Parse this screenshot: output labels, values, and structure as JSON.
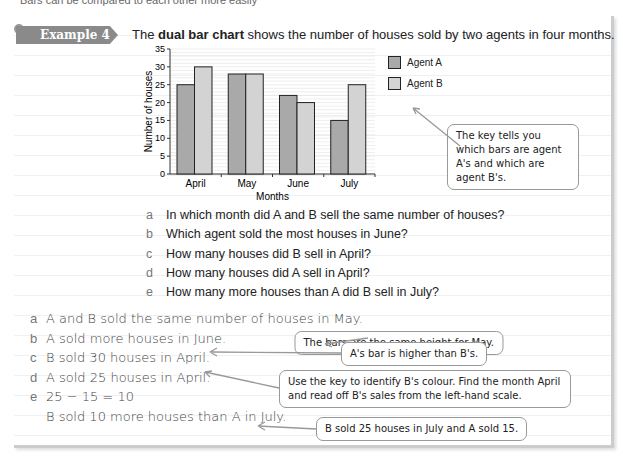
{
  "top_text": "Bars can be compared to each other more easily",
  "example": {
    "label": "Example 4",
    "intro_pre": "The ",
    "intro_bold": "dual bar chart",
    "intro_post": " shows the number of houses sold by two agents in four months."
  },
  "chart_data": {
    "type": "bar",
    "title": "",
    "xlabel": "Months",
    "ylabel": "Number of houses",
    "ylim": [
      0,
      35
    ],
    "yticks": [
      0,
      5,
      10,
      15,
      20,
      25,
      30,
      35
    ],
    "grid": true,
    "legend_position": "right",
    "categories": [
      "April",
      "May",
      "June",
      "July"
    ],
    "series": [
      {
        "name": "Agent A",
        "color": "#a9a9a9",
        "values": [
          25,
          28,
          22,
          15
        ]
      },
      {
        "name": "Agent B",
        "color": "#d3d3d3",
        "values": [
          30,
          28,
          20,
          25
        ]
      }
    ]
  },
  "key_callout": "The key tells you which bars are agent A's and which are agent B's.",
  "questions": [
    {
      "letter": "a",
      "text": "In which month did A and B sell the same number of houses?"
    },
    {
      "letter": "b",
      "text": "Which agent sold the most houses in June?"
    },
    {
      "letter": "c",
      "text": "How many houses did B sell in April?"
    },
    {
      "letter": "d",
      "text": "How many houses did A sell in April?"
    },
    {
      "letter": "e",
      "text": "How many more houses than A did B sell in July?"
    }
  ],
  "answers": [
    {
      "letter": "a",
      "text": "A and B sold the same number of houses in May."
    },
    {
      "letter": "b",
      "text": "A sold more houses in June."
    },
    {
      "letter": "c",
      "text": "B sold 30 houses in April."
    },
    {
      "letter": "d",
      "text": "A sold 25 houses in April."
    },
    {
      "letter": "e",
      "text": "25 − 15 = 10"
    },
    {
      "letter": "",
      "text": "B sold 10 more houses than A in July."
    }
  ],
  "callouts": [
    "The bars are the same height for May.",
    "A's bar is higher than B's.",
    "Use the key to identify B's colour. Find the month April and read off B's sales from the left-hand scale.",
    "B sold 25 houses in July and A sold 15."
  ]
}
